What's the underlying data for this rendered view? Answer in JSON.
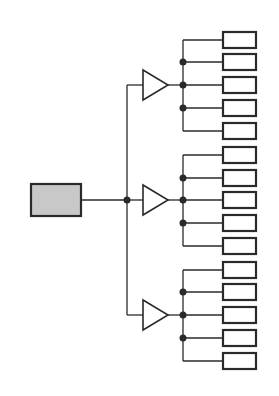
{
  "diagram": {
    "title": "",
    "type": "clock-distribution-tree",
    "colors": {
      "line": "#2a2a2a",
      "source_fill": "#c8c8c8",
      "sink_fill": "#ffffff",
      "background": "#ffffff"
    },
    "source": {
      "x": 31,
      "y": 184,
      "w": 50,
      "h": 32
    },
    "trunk_x": 127,
    "junction_y": 200,
    "buffer": {
      "left_x": 143,
      "apex_x": 168,
      "half_height": 15
    },
    "bus_x": 183,
    "sink": {
      "x": 223,
      "w": 33,
      "h": 16
    },
    "groups": [
      {
        "name": "group-1",
        "center_y": 85,
        "sink_ys": [
          40,
          62,
          85,
          108,
          131
        ]
      },
      {
        "name": "group-2",
        "center_y": 200,
        "sink_ys": [
          155,
          178,
          200,
          223,
          246
        ]
      },
      {
        "name": "group-3",
        "center_y": 315,
        "sink_ys": [
          270,
          292,
          315,
          338,
          361
        ]
      }
    ],
    "dot_radius": 3.5
  }
}
